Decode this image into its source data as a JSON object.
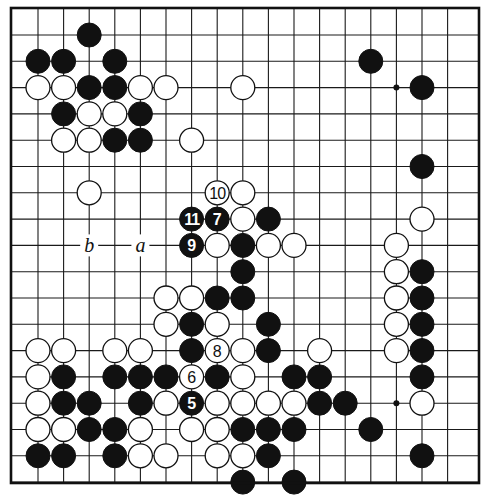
{
  "board": {
    "columns": 17,
    "rows": 18,
    "origin_x": 38,
    "origin_y": 35,
    "spacing_x": 25.6,
    "spacing_y": 26.3,
    "stone_radius": 12,
    "frame": {
      "left": 11,
      "top": 8,
      "right": 479,
      "bottom": 483
    },
    "colors": {
      "black": "#111111",
      "white": "#ffffff",
      "line": "#1a1a1a"
    }
  },
  "star_points": [
    {
      "col": 14,
      "row": 2
    },
    {
      "col": 14,
      "row": 14
    }
  ],
  "stones": [
    {
      "col": 2,
      "row": 0,
      "color": "black"
    },
    {
      "col": 0,
      "row": 1,
      "color": "black"
    },
    {
      "col": 1,
      "row": 1,
      "color": "black"
    },
    {
      "col": 3,
      "row": 1,
      "color": "black"
    },
    {
      "col": 13,
      "row": 1,
      "color": "black"
    },
    {
      "col": 0,
      "row": 2,
      "color": "white"
    },
    {
      "col": 1,
      "row": 2,
      "color": "white"
    },
    {
      "col": 2,
      "row": 2,
      "color": "black"
    },
    {
      "col": 3,
      "row": 2,
      "color": "black"
    },
    {
      "col": 4,
      "row": 2,
      "color": "white"
    },
    {
      "col": 5,
      "row": 2,
      "color": "white"
    },
    {
      "col": 8,
      "row": 2,
      "color": "white"
    },
    {
      "col": 15,
      "row": 2,
      "color": "black"
    },
    {
      "col": 1,
      "row": 3,
      "color": "black"
    },
    {
      "col": 2,
      "row": 3,
      "color": "white"
    },
    {
      "col": 3,
      "row": 3,
      "color": "white"
    },
    {
      "col": 4,
      "row": 3,
      "color": "black"
    },
    {
      "col": 1,
      "row": 4,
      "color": "white"
    },
    {
      "col": 2,
      "row": 4,
      "color": "white"
    },
    {
      "col": 3,
      "row": 4,
      "color": "black"
    },
    {
      "col": 4,
      "row": 4,
      "color": "black"
    },
    {
      "col": 6,
      "row": 4,
      "color": "white"
    },
    {
      "col": 15,
      "row": 5,
      "color": "black"
    },
    {
      "col": 2,
      "row": 6,
      "color": "white"
    },
    {
      "col": 7,
      "row": 6,
      "color": "white",
      "number": "10"
    },
    {
      "col": 8,
      "row": 6,
      "color": "white"
    },
    {
      "col": 6,
      "row": 7,
      "color": "black",
      "number": "11"
    },
    {
      "col": 7,
      "row": 7,
      "color": "black",
      "number": "7"
    },
    {
      "col": 8,
      "row": 7,
      "color": "white"
    },
    {
      "col": 9,
      "row": 7,
      "color": "black"
    },
    {
      "col": 15,
      "row": 7,
      "color": "white"
    },
    {
      "col": 6,
      "row": 8,
      "color": "black",
      "number": "9"
    },
    {
      "col": 7,
      "row": 8,
      "color": "white"
    },
    {
      "col": 8,
      "row": 8,
      "color": "black"
    },
    {
      "col": 9,
      "row": 8,
      "color": "white"
    },
    {
      "col": 10,
      "row": 8,
      "color": "white"
    },
    {
      "col": 14,
      "row": 8,
      "color": "white"
    },
    {
      "col": 8,
      "row": 9,
      "color": "black"
    },
    {
      "col": 14,
      "row": 9,
      "color": "white"
    },
    {
      "col": 15,
      "row": 9,
      "color": "black"
    },
    {
      "col": 5,
      "row": 10,
      "color": "white"
    },
    {
      "col": 6,
      "row": 10,
      "color": "white"
    },
    {
      "col": 7,
      "row": 10,
      "color": "black"
    },
    {
      "col": 8,
      "row": 10,
      "color": "black"
    },
    {
      "col": 14,
      "row": 10,
      "color": "white"
    },
    {
      "col": 15,
      "row": 10,
      "color": "black"
    },
    {
      "col": 5,
      "row": 11,
      "color": "white"
    },
    {
      "col": 6,
      "row": 11,
      "color": "black"
    },
    {
      "col": 7,
      "row": 11,
      "color": "white"
    },
    {
      "col": 9,
      "row": 11,
      "color": "black"
    },
    {
      "col": 14,
      "row": 11,
      "color": "white"
    },
    {
      "col": 15,
      "row": 11,
      "color": "black"
    },
    {
      "col": 0,
      "row": 12,
      "color": "white"
    },
    {
      "col": 1,
      "row": 12,
      "color": "white"
    },
    {
      "col": 3,
      "row": 12,
      "color": "white"
    },
    {
      "col": 4,
      "row": 12,
      "color": "white"
    },
    {
      "col": 6,
      "row": 12,
      "color": "black"
    },
    {
      "col": 7,
      "row": 12,
      "color": "white",
      "number": "8"
    },
    {
      "col": 8,
      "row": 12,
      "color": "white"
    },
    {
      "col": 9,
      "row": 12,
      "color": "black"
    },
    {
      "col": 11,
      "row": 12,
      "color": "white"
    },
    {
      "col": 14,
      "row": 12,
      "color": "white"
    },
    {
      "col": 15,
      "row": 12,
      "color": "black"
    },
    {
      "col": 0,
      "row": 13,
      "color": "white"
    },
    {
      "col": 1,
      "row": 13,
      "color": "black"
    },
    {
      "col": 3,
      "row": 13,
      "color": "black"
    },
    {
      "col": 4,
      "row": 13,
      "color": "black"
    },
    {
      "col": 5,
      "row": 13,
      "color": "black"
    },
    {
      "col": 6,
      "row": 13,
      "color": "white",
      "number": "6"
    },
    {
      "col": 7,
      "row": 13,
      "color": "black"
    },
    {
      "col": 8,
      "row": 13,
      "color": "white"
    },
    {
      "col": 10,
      "row": 13,
      "color": "black"
    },
    {
      "col": 11,
      "row": 13,
      "color": "black"
    },
    {
      "col": 15,
      "row": 13,
      "color": "black"
    },
    {
      "col": 0,
      "row": 14,
      "color": "white"
    },
    {
      "col": 1,
      "row": 14,
      "color": "black"
    },
    {
      "col": 2,
      "row": 14,
      "color": "black"
    },
    {
      "col": 4,
      "row": 14,
      "color": "black"
    },
    {
      "col": 5,
      "row": 14,
      "color": "white"
    },
    {
      "col": 6,
      "row": 14,
      "color": "black",
      "number": "5"
    },
    {
      "col": 7,
      "row": 14,
      "color": "white"
    },
    {
      "col": 8,
      "row": 14,
      "color": "white"
    },
    {
      "col": 9,
      "row": 14,
      "color": "white"
    },
    {
      "col": 10,
      "row": 14,
      "color": "white"
    },
    {
      "col": 11,
      "row": 14,
      "color": "black"
    },
    {
      "col": 12,
      "row": 14,
      "color": "black"
    },
    {
      "col": 15,
      "row": 14,
      "color": "white"
    },
    {
      "col": 0,
      "row": 15,
      "color": "white"
    },
    {
      "col": 1,
      "row": 15,
      "color": "white"
    },
    {
      "col": 2,
      "row": 15,
      "color": "black"
    },
    {
      "col": 3,
      "row": 15,
      "color": "black"
    },
    {
      "col": 4,
      "row": 15,
      "color": "white"
    },
    {
      "col": 6,
      "row": 15,
      "color": "white"
    },
    {
      "col": 7,
      "row": 15,
      "color": "white"
    },
    {
      "col": 8,
      "row": 15,
      "color": "black"
    },
    {
      "col": 9,
      "row": 15,
      "color": "black"
    },
    {
      "col": 10,
      "row": 15,
      "color": "black"
    },
    {
      "col": 13,
      "row": 15,
      "color": "black"
    },
    {
      "col": 0,
      "row": 16,
      "color": "black"
    },
    {
      "col": 1,
      "row": 16,
      "color": "black"
    },
    {
      "col": 3,
      "row": 16,
      "color": "black"
    },
    {
      "col": 4,
      "row": 16,
      "color": "white"
    },
    {
      "col": 5,
      "row": 16,
      "color": "white"
    },
    {
      "col": 7,
      "row": 16,
      "color": "white"
    },
    {
      "col": 8,
      "row": 16,
      "color": "white"
    },
    {
      "col": 9,
      "row": 16,
      "color": "black"
    },
    {
      "col": 15,
      "row": 16,
      "color": "black"
    },
    {
      "col": 8,
      "row": 17,
      "color": "black"
    },
    {
      "col": 10,
      "row": 17,
      "color": "black"
    }
  ],
  "labels": [
    {
      "col": 2,
      "row": 8,
      "text": "b"
    },
    {
      "col": 4,
      "row": 8,
      "text": "a"
    }
  ]
}
